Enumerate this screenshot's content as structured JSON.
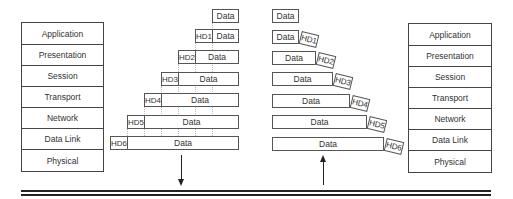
{
  "left_stack": {
    "layers": [
      "Application",
      "Presentation",
      "Session",
      "Transport",
      "Network",
      "Data Link",
      "Physical"
    ]
  },
  "right_stack": {
    "layers": [
      "Application",
      "Presentation",
      "Session",
      "Transport",
      "Network",
      "Data Link",
      "Physical"
    ]
  },
  "sender_packets": [
    {
      "header": "",
      "data": "Data"
    },
    {
      "header": "HD1",
      "data": "Data"
    },
    {
      "header": "HD2",
      "data": "Data"
    },
    {
      "header": "HD3",
      "data": "Data"
    },
    {
      "header": "HD4",
      "data": "Data"
    },
    {
      "header": "HD5",
      "data": "Data"
    },
    {
      "header": "HD6",
      "data": "Data"
    }
  ],
  "receiver_packets": [
    {
      "header": "",
      "data": "Data"
    },
    {
      "header": "HD1",
      "data": "Data"
    },
    {
      "header": "HD2",
      "data": "Data"
    },
    {
      "header": "HD3",
      "data": "Data"
    },
    {
      "header": "HD4",
      "data": "Data"
    },
    {
      "header": "HD5",
      "data": "Data"
    },
    {
      "header": "HD6",
      "data": "Data"
    }
  ],
  "arrows": {
    "sender": "down",
    "receiver": "up"
  },
  "colors": {
    "line": "#444444",
    "bus": "#222222",
    "background": "#ffffff"
  }
}
